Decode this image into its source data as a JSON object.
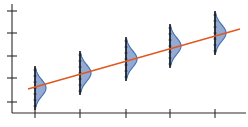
{
  "chart_data": {
    "type": "line",
    "title": "",
    "xlabel": "",
    "ylabel": "",
    "grid": false,
    "legend": null,
    "x_ticks": [
      1,
      2,
      3,
      4,
      5
    ],
    "y_ticks": [
      1,
      2,
      3,
      4,
      5
    ],
    "xlim": [
      0.5,
      5.7
    ],
    "ylim": [
      0.5,
      5.5
    ],
    "regression_line": {
      "x": [
        0.8,
        5.5
      ],
      "y": [
        1.6,
        4.2
      ],
      "color": "#e0571f"
    },
    "distributions": [
      {
        "x": 1,
        "mean": 1.6,
        "spread": 0.9
      },
      {
        "x": 2,
        "mean": 2.2,
        "spread": 0.9
      },
      {
        "x": 3,
        "mean": 2.8,
        "spread": 0.9
      },
      {
        "x": 4,
        "mean": 3.4,
        "spread": 0.9
      },
      {
        "x": 5,
        "mean": 4.0,
        "spread": 0.9
      }
    ],
    "colors": {
      "line": "#e0571f",
      "distribution_fill": "#8fa6cf",
      "distribution_edge": "#3c6db3",
      "axis": "#2b2b2b"
    }
  },
  "layout_px": {
    "origin": {
      "x": 12,
      "y": 113
    },
    "x_axis_end": 246,
    "y_axis_top": 4,
    "x_tick_px": [
      35,
      80,
      126,
      170,
      215
    ],
    "y_tick_px": [
      102,
      78,
      56,
      33,
      11
    ],
    "line_px": {
      "x1": 28,
      "y1": 89,
      "x2": 240,
      "y2": 29
    },
    "dist_centers_px": [
      {
        "x": 35,
        "y": 88
      },
      {
        "x": 80,
        "y": 73
      },
      {
        "x": 126,
        "y": 59
      },
      {
        "x": 170,
        "y": 46
      },
      {
        "x": 215,
        "y": 33
      }
    ],
    "dist_half_height": 20,
    "dist_peak_width": 11
  }
}
